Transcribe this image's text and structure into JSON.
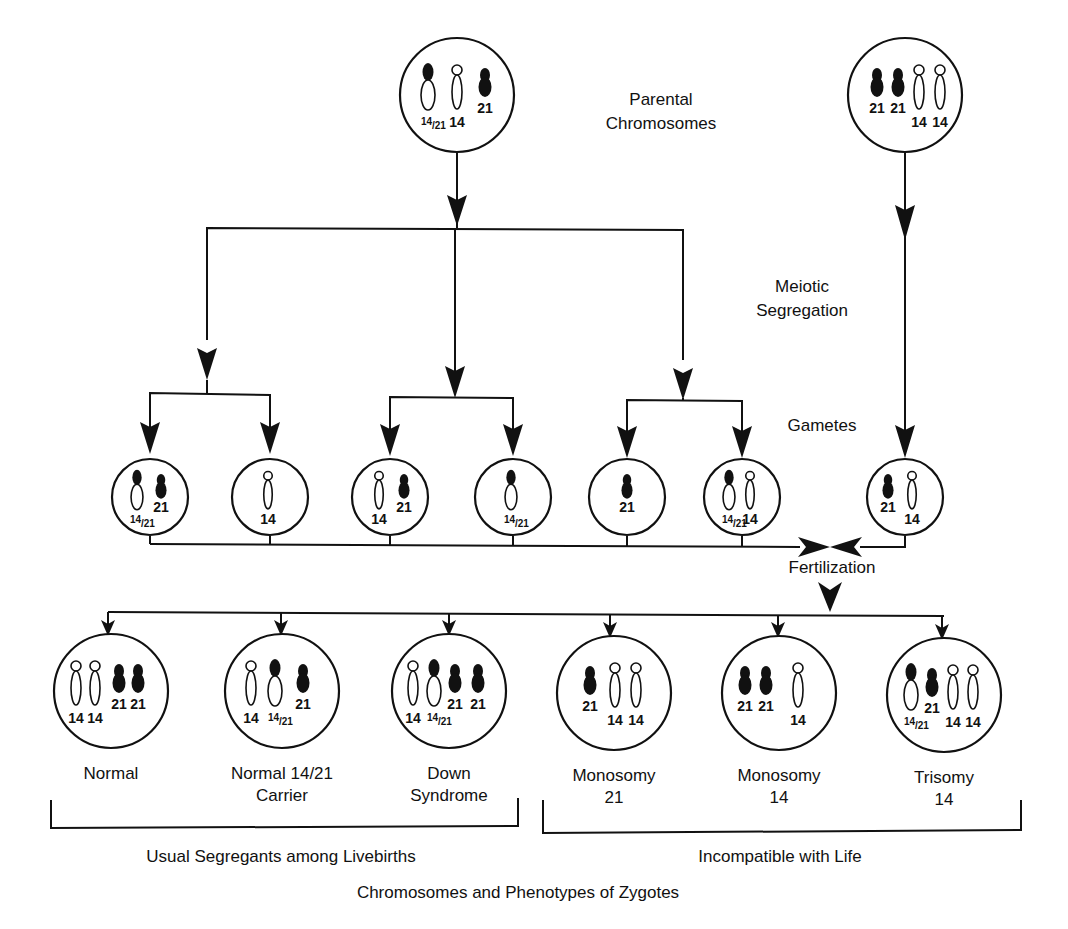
{
  "labels": {
    "parental": [
      "Parental",
      "Chromosomes"
    ],
    "meiotic": [
      "Meiotic",
      "Segregation"
    ],
    "gametes": "Gametes",
    "fertilization": "Fertilization",
    "livebirths": "Usual Segregants among Livebirths",
    "incompatible": "Incompatible with Life",
    "footer": "Chromosomes and Phenotypes of Zygotes"
  },
  "colors": {
    "ink": "#111111",
    "paper": "#ffffff"
  },
  "parents": [
    {
      "id": "carrier-parent",
      "cx": 457,
      "cy": 95,
      "r": 57,
      "chromosomes": [
        {
          "type": "translocation",
          "x": 428,
          "label": "14/21"
        },
        {
          "type": "14",
          "x": 457,
          "label": "14"
        },
        {
          "type": "21",
          "x": 485,
          "label": "21"
        }
      ]
    },
    {
      "id": "normal-parent",
      "cx": 905,
      "cy": 95,
      "r": 57,
      "chromosomes": [
        {
          "type": "21",
          "x": 877,
          "label": "21"
        },
        {
          "type": "21",
          "x": 898,
          "label": "21"
        },
        {
          "type": "14",
          "x": 919,
          "label": "14"
        },
        {
          "type": "14",
          "x": 940,
          "label": "14"
        }
      ]
    }
  ],
  "gametes": [
    {
      "cx": 150,
      "cy": 497,
      "chromosomes": [
        {
          "type": "translocation",
          "x": 137,
          "label": "14/21"
        },
        {
          "type": "21",
          "x": 161,
          "label": "21"
        }
      ]
    },
    {
      "cx": 270,
      "cy": 497,
      "chromosomes": [
        {
          "type": "14",
          "x": 268,
          "label": "14"
        }
      ]
    },
    {
      "cx": 390,
      "cy": 497,
      "chromosomes": [
        {
          "type": "14",
          "x": 379,
          "label": "14"
        },
        {
          "type": "21",
          "x": 404,
          "label": "21"
        }
      ]
    },
    {
      "cx": 513,
      "cy": 497,
      "chromosomes": [
        {
          "type": "translocation",
          "x": 511,
          "label": "14/21"
        }
      ]
    },
    {
      "cx": 627,
      "cy": 497,
      "chromosomes": [
        {
          "type": "21",
          "x": 627,
          "label": "21"
        }
      ]
    },
    {
      "cx": 742,
      "cy": 497,
      "chromosomes": [
        {
          "type": "translocation",
          "x": 729,
          "label": "14/21"
        },
        {
          "type": "14",
          "x": 750,
          "label": "14"
        }
      ]
    },
    {
      "cx": 905,
      "cy": 497,
      "chromosomes": [
        {
          "type": "21",
          "x": 888,
          "label": "21"
        },
        {
          "type": "14",
          "x": 912,
          "label": "14"
        }
      ]
    }
  ],
  "zygotes": [
    {
      "cx": 111,
      "cy": 691,
      "name": [
        "Normal"
      ],
      "chromosomes": [
        {
          "type": "14",
          "x": 76,
          "label": "14"
        },
        {
          "type": "14",
          "x": 95,
          "label": "14"
        },
        {
          "type": "21",
          "x": 119,
          "label": "21"
        },
        {
          "type": "21",
          "x": 138,
          "label": "21"
        }
      ]
    },
    {
      "cx": 282,
      "cy": 691,
      "name": [
        "Normal  14/21",
        "Carrier"
      ],
      "chromosomes": [
        {
          "type": "14",
          "x": 251,
          "label": "14"
        },
        {
          "type": "translocation",
          "x": 275,
          "label": "14/21"
        },
        {
          "type": "21",
          "x": 303,
          "label": "21"
        }
      ]
    },
    {
      "cx": 449,
      "cy": 691,
      "name": [
        "Down",
        "Syndrome"
      ],
      "chromosomes": [
        {
          "type": "14",
          "x": 413,
          "label": "14"
        },
        {
          "type": "translocation",
          "x": 434,
          "label": "14/21"
        },
        {
          "type": "21",
          "x": 455,
          "label": "21"
        },
        {
          "type": "21",
          "x": 478,
          "label": "21"
        }
      ]
    },
    {
      "cx": 614,
      "cy": 693,
      "name": [
        "Monosomy",
        "21"
      ],
      "chromosomes": [
        {
          "type": "21",
          "x": 590,
          "label": "21"
        },
        {
          "type": "14",
          "x": 615,
          "label": "14"
        },
        {
          "type": "14",
          "x": 636,
          "label": "14"
        }
      ]
    },
    {
      "cx": 779,
      "cy": 693,
      "name": [
        "Monosomy",
        "14"
      ],
      "chromosomes": [
        {
          "type": "21",
          "x": 745,
          "label": "21"
        },
        {
          "type": "21",
          "x": 766,
          "label": "21"
        },
        {
          "type": "14",
          "x": 798,
          "label": "14"
        }
      ]
    },
    {
      "cx": 944,
      "cy": 695,
      "name": [
        "Trisomy",
        "14"
      ],
      "chromosomes": [
        {
          "type": "translocation",
          "x": 911,
          "label": "14/21"
        },
        {
          "type": "21",
          "x": 932,
          "label": "21"
        },
        {
          "type": "14",
          "x": 953,
          "label": "14"
        },
        {
          "type": "14",
          "x": 973,
          "label": "14"
        }
      ]
    }
  ]
}
